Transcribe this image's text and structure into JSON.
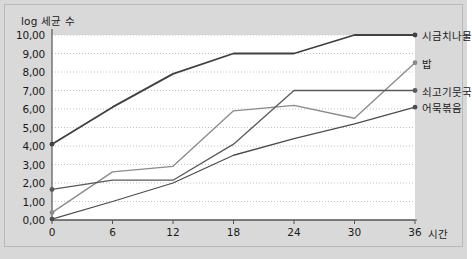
{
  "chart_data": {
    "type": "line",
    "title": "",
    "ylabel": "log 세균 수",
    "xlabel": "시간",
    "x": [
      0,
      6,
      12,
      18,
      24,
      30,
      36
    ],
    "xticks": [
      "0",
      "6",
      "12",
      "18",
      "24",
      "30",
      "36"
    ],
    "yticks": [
      "0,00",
      "1,00",
      "2,00",
      "3,00",
      "4,00",
      "5,00",
      "6,00",
      "7,00",
      "8,00",
      "9,00",
      "10,00"
    ],
    "xlim": [
      0,
      36
    ],
    "ylim": [
      0,
      10
    ],
    "grid": true,
    "legend_position": "right-inline-labels",
    "series": [
      {
        "name": "시금치나물",
        "color": "#404040",
        "values": [
          4.1,
          6.1,
          7.9,
          9.0,
          9.0,
          10.0,
          10.0
        ]
      },
      {
        "name": "밥",
        "color": "#8a8a8a",
        "values": [
          0.4,
          2.6,
          2.9,
          5.9,
          6.2,
          5.5,
          8.5
        ]
      },
      {
        "name": "쇠고기뭇국",
        "color": "#595959",
        "values": [
          1.65,
          2.15,
          2.15,
          4.1,
          7.0,
          7.0,
          7.0
        ]
      },
      {
        "name": "어묵볶음",
        "color": "#4d4d4d",
        "values": [
          0.05,
          1.0,
          2.0,
          3.5,
          4.4,
          5.2,
          6.1
        ]
      }
    ]
  },
  "caption": ""
}
